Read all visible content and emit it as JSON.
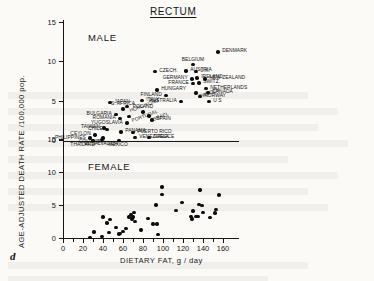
{
  "figure": {
    "letter": "d",
    "title": "RECTUM",
    "panels": [
      {
        "tag": "MALE"
      },
      {
        "tag": "FEMALE"
      }
    ]
  },
  "axes": {
    "x_label": "DIETARY FAT,  g / day",
    "y_label": "AGE-ADJUSTED DEATH RATE /100,000 pop.",
    "x_ticks": [
      "0",
      "20",
      "40",
      "60",
      "80",
      "100",
      "120",
      "140",
      "160"
    ],
    "y_ticks": [
      "0",
      "5",
      "10",
      "15"
    ]
  },
  "chart_data": {
    "type": "scatter",
    "title": "RECTUM",
    "xlabel": "DIETARY FAT,  g / day",
    "ylabel": "AGE-ADJUSTED DEATH RATE /100,000 pop.",
    "xlim": [
      0,
      172
    ],
    "ylim": [
      0,
      15
    ],
    "grid": false,
    "legend": "none",
    "panels": [
      {
        "name": "MALE",
        "label_position": "upper-left",
        "points": [
          {
            "country": "PHILIPPINES",
            "x": 27,
            "y": 0.3,
            "label_side": "left"
          },
          {
            "country": "THAILAND",
            "x": 30,
            "y": 0.0,
            "label_side": "below-left"
          },
          {
            "country": "CEYLON",
            "x": 32,
            "y": 0.7,
            "label_side": "left"
          },
          {
            "country": "EL SALVADOR",
            "x": 39,
            "y": 0.1,
            "label_side": "below"
          },
          {
            "country": "COLOMBIA",
            "x": 40,
            "y": 0.3,
            "label_side": "below-left"
          },
          {
            "country": "TAIWAN",
            "x": 41,
            "y": 1.6,
            "label_side": "left"
          },
          {
            "country": "CHILE",
            "x": 44,
            "y": 1.4,
            "label_side": "left"
          },
          {
            "country": "JAPAN",
            "x": 47,
            "y": 4.8,
            "label_side": "right"
          },
          {
            "country": "BULGARIA",
            "x": 53,
            "y": 3.3,
            "label_side": "left"
          },
          {
            "country": "MEXICO",
            "x": 56,
            "y": 0.0,
            "label_side": "below"
          },
          {
            "country": "ROMANIA",
            "x": 57,
            "y": 2.8,
            "label_side": "left"
          },
          {
            "country": "PANAMA",
            "x": 58,
            "y": 1.1,
            "label_side": "right"
          },
          {
            "country": "S. AFRICA",
            "x": 60,
            "y": 4.0,
            "label_side": "above"
          },
          {
            "country": "HONG KONG",
            "x": 64,
            "y": 4.3,
            "label_side": "right-rot"
          },
          {
            "country": "YUGOSLAVIA",
            "x": 64,
            "y": 2.2,
            "label_side": "left"
          },
          {
            "country": "PORTUGAL",
            "x": 66,
            "y": 3.0,
            "label_side": "right-rot"
          },
          {
            "country": "PUERTO RICO",
            "x": 70,
            "y": 1.0,
            "label_side": "right"
          },
          {
            "country": "VENEZUELA",
            "x": 72,
            "y": 0.4,
            "label_side": "right"
          },
          {
            "country": "GREECE",
            "x": 86,
            "y": 0.4,
            "label_side": "right"
          },
          {
            "country": "ITALY",
            "x": 79,
            "y": 5.1,
            "label_side": "right"
          },
          {
            "country": "POLAND",
            "x": 80,
            "y": 3.6,
            "label_side": "above"
          },
          {
            "country": "ISRAEL",
            "x": 86,
            "y": 3.1,
            "label_side": "right-rot"
          },
          {
            "country": "SPAIN",
            "x": 89,
            "y": 2.6,
            "label_side": "right"
          },
          {
            "country": "CZECH.",
            "x": 92,
            "y": 8.7,
            "label_side": "right"
          },
          {
            "country": "HUNGARY",
            "x": 94,
            "y": 6.4,
            "label_side": "right"
          },
          {
            "country": "FINLAND",
            "x": 103,
            "y": 5.7,
            "label_side": "left"
          },
          {
            "country": "AUSTRALIA",
            "x": 118,
            "y": 4.9,
            "label_side": "left"
          },
          {
            "country": "AUSTRIA",
            "x": 123,
            "y": 8.8,
            "label_side": "right"
          },
          {
            "country": "BELGIUM",
            "x": 130,
            "y": 9.6,
            "label_side": "above"
          },
          {
            "country": "GERMANY",
            "x": 129,
            "y": 7.8,
            "label_side": "left"
          },
          {
            "country": "FRANCE",
            "x": 130,
            "y": 7.2,
            "label_side": "left"
          },
          {
            "country": "U.K.",
            "x": 133,
            "y": 8.7,
            "label_side": "right"
          },
          {
            "country": "IRELAND",
            "x": 134,
            "y": 7.9,
            "label_side": "right"
          },
          {
            "country": "SWITZ.",
            "x": 136,
            "y": 7.3,
            "label_side": "right"
          },
          {
            "country": "SWEDEN",
            "x": 133,
            "y": 6.0,
            "label_side": "right-rot"
          },
          {
            "country": "NORWAY",
            "x": 137,
            "y": 5.6,
            "label_side": "right"
          },
          {
            "country": "NETHERLANDS",
            "x": 143,
            "y": 6.6,
            "label_side": "right"
          },
          {
            "country": "CANADA",
            "x": 145,
            "y": 6.1,
            "label_side": "right"
          },
          {
            "country": "NEW ZEALAND",
            "x": 142,
            "y": 7.8,
            "label_side": "right"
          },
          {
            "country": "U S",
            "x": 146,
            "y": 4.9,
            "label_side": "right"
          },
          {
            "country": "DENMARK",
            "x": 155,
            "y": 11.2,
            "label_side": "right"
          }
        ]
      },
      {
        "name": "FEMALE",
        "label_position": "upper-left",
        "points": [
          {
            "x": 27,
            "y": 0.1
          },
          {
            "x": 31,
            "y": 0.9
          },
          {
            "x": 39,
            "y": 0.2
          },
          {
            "x": 40,
            "y": 3.2
          },
          {
            "x": 44,
            "y": 2.3
          },
          {
            "x": 46,
            "y": 0.8
          },
          {
            "x": 47,
            "y": 2.8
          },
          {
            "x": 53,
            "y": 1.6
          },
          {
            "x": 56,
            "y": 0.6
          },
          {
            "x": 57,
            "y": 0.7
          },
          {
            "x": 60,
            "y": 1.0
          },
          {
            "x": 63,
            "y": 1.4
          },
          {
            "x": 66,
            "y": 3.2
          },
          {
            "x": 68,
            "y": 3.6
          },
          {
            "x": 69,
            "y": 2.9
          },
          {
            "x": 70,
            "y": 3.2
          },
          {
            "x": 71,
            "y": 3.9
          },
          {
            "x": 72,
            "y": 2.5
          },
          {
            "x": 78,
            "y": 1.2
          },
          {
            "x": 85,
            "y": 3.0
          },
          {
            "x": 90,
            "y": 2.1
          },
          {
            "x": 93,
            "y": 5.0
          },
          {
            "x": 94,
            "y": 2.1
          },
          {
            "x": 95,
            "y": 0.5
          },
          {
            "x": 99,
            "y": 7.7
          },
          {
            "x": 99,
            "y": 6.6
          },
          {
            "x": 113,
            "y": 4.2
          },
          {
            "x": 119,
            "y": 5.4
          },
          {
            "x": 128,
            "y": 3.3
          },
          {
            "x": 129,
            "y": 2.9
          },
          {
            "x": 130,
            "y": 4.1
          },
          {
            "x": 133,
            "y": 3.3
          },
          {
            "x": 135,
            "y": 3.3
          },
          {
            "x": 136,
            "y": 5.1
          },
          {
            "x": 137,
            "y": 7.3
          },
          {
            "x": 139,
            "y": 4.9
          },
          {
            "x": 140,
            "y": 3.9
          },
          {
            "x": 147,
            "y": 3.1
          },
          {
            "x": 152,
            "y": 3.8
          },
          {
            "x": 153,
            "y": 4.3
          },
          {
            "x": 156,
            "y": 6.5
          }
        ]
      }
    ]
  }
}
